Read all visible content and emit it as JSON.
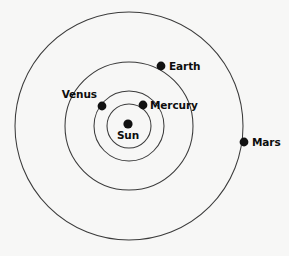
{
  "diagram": {
    "background_color": "#f7f7f6",
    "orbit_stroke_color": "#3b3b3b",
    "body_dot_color": "#111111",
    "label_color": "#0d0d0d",
    "center": {
      "x": 129,
      "y": 126
    },
    "center_body": {
      "name": "sun",
      "label": "Sun",
      "dot": {
        "x": 128,
        "y": 124,
        "r": 4.6
      },
      "label_pos": {
        "x": 128,
        "y": 139
      },
      "label_anchor": "middle"
    },
    "orbits": [
      {
        "name": "mercury-orbit",
        "radius": 22
      },
      {
        "name": "venus-orbit",
        "radius": 35
      },
      {
        "name": "earth-orbit",
        "radius": 64
      },
      {
        "name": "mars-orbit",
        "radius": 114
      }
    ],
    "planets": [
      {
        "name": "mercury",
        "label": "Mercury",
        "orbit_radius": 22,
        "dot": {
          "x": 143,
          "y": 105,
          "r": 4.4
        },
        "label_pos": {
          "x": 150,
          "y": 109
        },
        "label_anchor": "start"
      },
      {
        "name": "venus",
        "label": "Venus",
        "orbit_radius": 35,
        "dot": {
          "x": 102,
          "y": 106,
          "r": 4.4
        },
        "label_pos": {
          "x": 97,
          "y": 98
        },
        "label_anchor": "end"
      },
      {
        "name": "earth",
        "label": "Earth",
        "orbit_radius": 64,
        "dot": {
          "x": 161,
          "y": 66,
          "r": 4.4
        },
        "label_pos": {
          "x": 169,
          "y": 70
        },
        "label_anchor": "start"
      },
      {
        "name": "mars",
        "label": "Mars",
        "orbit_radius": 114,
        "dot": {
          "x": 244,
          "y": 142,
          "r": 4.4
        },
        "label_pos": {
          "x": 252,
          "y": 146
        },
        "label_anchor": "start"
      }
    ]
  }
}
